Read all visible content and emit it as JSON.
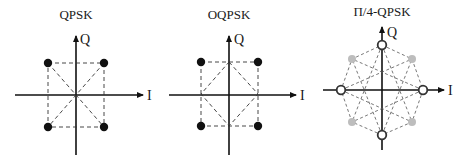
{
  "diagrams": [
    {
      "id": "qpsk",
      "title": "QPSK",
      "x_axis_label": "I",
      "y_axis_label": "Q",
      "points": [
        "top-left",
        "top-right",
        "bottom-left",
        "bottom-right"
      ],
      "point_style": "filled-black",
      "transitions": "square edges and diagonals through origin"
    },
    {
      "id": "oqpsk",
      "title": "OQPSK",
      "x_axis_label": "I",
      "y_axis_label": "Q",
      "points": [
        "top-left",
        "top-right",
        "bottom-left",
        "bottom-right"
      ],
      "point_style": "filled-black",
      "transitions": "square edges plus diamond through axis midpoints (no origin crossing)"
    },
    {
      "id": "pi4-qpsk",
      "title": "Π/4-QPSK",
      "x_axis_label": "I",
      "y_axis_label": "Q",
      "points": [
        "top",
        "right",
        "bottom",
        "left",
        "top-left",
        "top-right",
        "bottom-left",
        "bottom-right"
      ],
      "point_style": "on-axis hollow rings, diagonal grey dots",
      "transitions": "octagon edges and star connections"
    }
  ],
  "colors": {
    "axis": "#111111",
    "filled_point": "#111111",
    "grey_point": "#bdbdbd",
    "dashed_line": "#333333"
  }
}
